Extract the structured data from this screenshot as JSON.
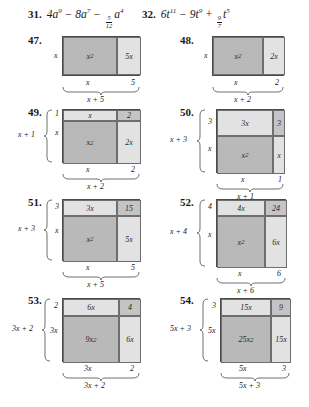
{
  "polynomials": [
    {
      "number": "31.",
      "expr_html": "4a^9 - 8a^7 - (5/12)a^4",
      "terms": [
        {
          "coef": "4",
          "var": "a",
          "exp": "9",
          "sign": ""
        },
        {
          "coef": "8",
          "var": "a",
          "exp": "7",
          "sign": "−"
        },
        {
          "coef_frac": {
            "num": "5",
            "den": "12"
          },
          "var": "a",
          "exp": "4",
          "sign": "−"
        }
      ]
    },
    {
      "number": "32.",
      "expr_html": "6t^11 - 9t^9 + (9/7)t^5",
      "terms": [
        {
          "coef": "6",
          "var": "t",
          "exp": "11",
          "sign": ""
        },
        {
          "coef": "9",
          "var": "t",
          "exp": "9",
          "sign": "−"
        },
        {
          "coef_frac": {
            "num": "9",
            "den": "7"
          },
          "var": "t",
          "exp": "5",
          "sign": "+"
        }
      ]
    }
  ],
  "exercises": [
    {
      "number": "47.",
      "layout": "one-row",
      "cells": [
        {
          "label": "x",
          "sup": "2",
          "shade": "dark"
        },
        {
          "label": "5x",
          "sup": "",
          "shade": "light"
        }
      ],
      "left_labels": [
        "x"
      ],
      "bottom_labels": [
        "x",
        "5"
      ],
      "bottom_total": "x + 5",
      "left_total": ""
    },
    {
      "number": "48.",
      "layout": "one-row",
      "cells": [
        {
          "label": "x",
          "sup": "2",
          "shade": "dark"
        },
        {
          "label": "2x",
          "sup": "",
          "shade": "light"
        }
      ],
      "left_labels": [
        "x"
      ],
      "bottom_labels": [
        "x",
        "2"
      ],
      "bottom_total": "x + 2",
      "left_total": ""
    },
    {
      "number": "49.",
      "layout": "two-row",
      "cells_top": [
        {
          "label": "x",
          "sup": "",
          "shade": "light"
        },
        {
          "label": "2",
          "sup": "",
          "shade": "blank"
        }
      ],
      "cells_bottom": [
        {
          "label": "x",
          "sup": "2",
          "shade": "dark"
        },
        {
          "label": "2x",
          "sup": "",
          "shade": "light"
        }
      ],
      "left_labels": [
        "1",
        "x"
      ],
      "left_total": "x + 1",
      "bottom_labels": [
        "x",
        "2"
      ],
      "bottom_total": "x + 2"
    },
    {
      "number": "50.",
      "layout": "two-row",
      "cells_top": [
        {
          "label": "3x",
          "sup": "",
          "shade": "light"
        },
        {
          "label": "3",
          "sup": "",
          "shade": "blank"
        }
      ],
      "cells_bottom": [
        {
          "label": "x",
          "sup": "2",
          "shade": "dark"
        },
        {
          "label": "x",
          "sup": "",
          "shade": "light"
        }
      ],
      "left_labels": [
        "3",
        "x"
      ],
      "left_total": "x + 3",
      "bottom_labels": [
        "x",
        "1"
      ],
      "bottom_total": "x + 1"
    },
    {
      "number": "51.",
      "layout": "two-row",
      "cells_top": [
        {
          "label": "3x",
          "sup": "",
          "shade": "light"
        },
        {
          "label": "15",
          "sup": "",
          "shade": "blank"
        }
      ],
      "cells_bottom": [
        {
          "label": "x",
          "sup": "2",
          "shade": "dark"
        },
        {
          "label": "5x",
          "sup": "",
          "shade": "light"
        }
      ],
      "left_labels": [
        "3",
        "x"
      ],
      "left_total": "x + 3",
      "bottom_labels": [
        "x",
        "5"
      ],
      "bottom_total": "x + 5"
    },
    {
      "number": "52.",
      "layout": "two-row",
      "cells_top": [
        {
          "label": "4x",
          "sup": "",
          "shade": "light"
        },
        {
          "label": "24",
          "sup": "",
          "shade": "blank"
        }
      ],
      "cells_bottom": [
        {
          "label": "x",
          "sup": "2",
          "shade": "dark"
        },
        {
          "label": "6x",
          "sup": "",
          "shade": "light"
        }
      ],
      "left_labels": [
        "4",
        "x"
      ],
      "left_total": "x + 4",
      "bottom_labels": [
        "x",
        "6"
      ],
      "bottom_total": "x + 6"
    },
    {
      "number": "53.",
      "layout": "two-row",
      "cells_top": [
        {
          "label": "6x",
          "sup": "",
          "shade": "light"
        },
        {
          "label": "4",
          "sup": "",
          "shade": "blank"
        }
      ],
      "cells_bottom": [
        {
          "label": "9x",
          "sup": "2",
          "shade": "dark"
        },
        {
          "label": "6x",
          "sup": "",
          "shade": "light"
        }
      ],
      "left_labels": [
        "2",
        "3x"
      ],
      "left_total": "3x + 2",
      "bottom_labels": [
        "3x",
        "2"
      ],
      "bottom_total": "3x + 2"
    },
    {
      "number": "54.",
      "layout": "two-row",
      "cells_top": [
        {
          "label": "15x",
          "sup": "",
          "shade": "light"
        },
        {
          "label": "9",
          "sup": "",
          "shade": "blank"
        }
      ],
      "cells_bottom": [
        {
          "label": "25x",
          "sup": "2",
          "shade": "dark"
        },
        {
          "label": "15x",
          "sup": "",
          "shade": "light"
        }
      ],
      "left_labels": [
        "3",
        "5x"
      ],
      "left_total": "5x + 3",
      "bottom_labels": [
        "5x",
        "3"
      ],
      "bottom_total": "5x + 3"
    }
  ]
}
